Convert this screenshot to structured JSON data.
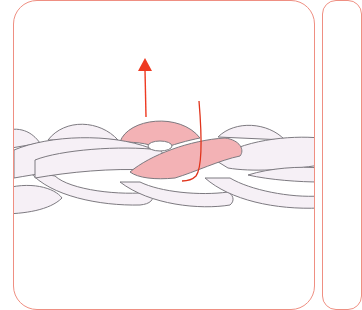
{
  "diagram": {
    "type": "crochet-step-illustration",
    "colors": {
      "panel_border": "#ef8f82",
      "loop_fill": "#f6f0f6",
      "loop_stroke": "#7d7a80",
      "highlight_fill": "#f3b2b5",
      "arrow": "#ee3a22",
      "yarn": "#e0341c"
    },
    "elements": {
      "chain": "braided-chain",
      "highlighted_loop": "active-loop",
      "arrow_direction": "up",
      "yarn_strand": "working-yarn"
    }
  }
}
